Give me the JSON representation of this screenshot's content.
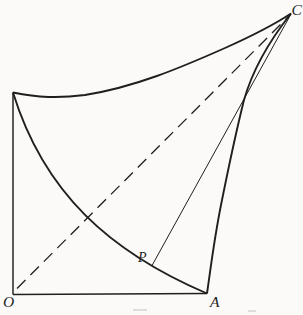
{
  "figure": {
    "labels": {
      "origin": "O",
      "base": "A",
      "point": "P",
      "apex": "C"
    },
    "colors": {
      "paper": "#fbfaf8",
      "ink": "#1f1f1f"
    },
    "geometry": {
      "left_side": "M 13 92.5 L 13 294.5",
      "baseline": "M 13 294.5 L 207 293.5",
      "main_curve": "M 13 92.5 C 44 193 110 252 207 293.5",
      "right_curve": "M 207 293.5 C 211 266 214 240 221 205 C 230 160 237 128 244 100 C 252 72 266 45 291 13.5",
      "top_curve": "M 13 92.5 C 38 97.5 58 98.5 85 95 C 135 87 180 68 225 48 C 253 35.5 272 26 291 13.5",
      "diagonal": "M 17 288.5 L 289.5 15.5",
      "normal_line": "M 152.3 265 L 291 14",
      "dash_pattern": "12 7"
    }
  }
}
